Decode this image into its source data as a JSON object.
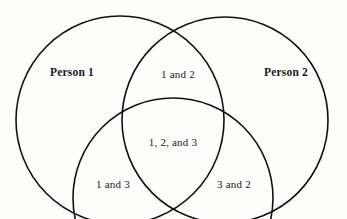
{
  "figure": {
    "type": "venn-diagram",
    "background_color": "#fdfdfc",
    "stroke_color": "#111111",
    "text_color": "#1a1a1a"
  },
  "sets": [
    {
      "id": "person-1",
      "label": "Person 1",
      "label_x": 72,
      "label_y": 72,
      "center_x": 120,
      "center_y": 120,
      "radius": 104
    },
    {
      "id": "person-2",
      "label": "Person 2",
      "label_x": 286,
      "label_y": 72,
      "center_x": 225,
      "center_y": 120,
      "radius": 103
    },
    {
      "id": "person-3",
      "label": "",
      "label_x": 173,
      "label_y": 260,
      "center_x": 173,
      "center_y": 198,
      "radius": 100
    }
  ],
  "regions": [
    {
      "id": "region-1-and-2",
      "label": "1 and 2",
      "x": 178,
      "y": 74
    },
    {
      "id": "region-1-2-and-3",
      "label": "1, 2, and 3",
      "x": 173,
      "y": 142
    },
    {
      "id": "region-1-and-3",
      "label": "1 and 3",
      "x": 113,
      "y": 184
    },
    {
      "id": "region-3-and-2",
      "label": "3 and 2",
      "x": 234,
      "y": 184
    }
  ]
}
